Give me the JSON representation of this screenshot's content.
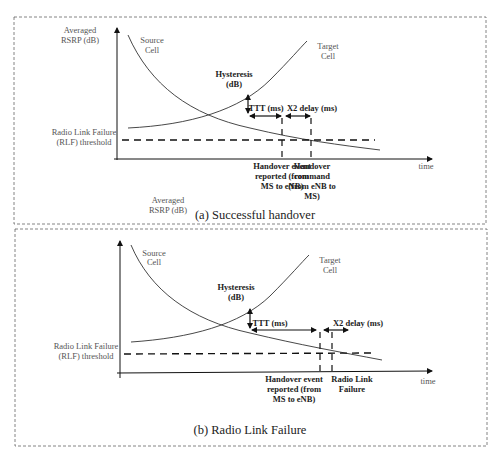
{
  "panels": [
    {
      "caption": "(a) Successful handover",
      "y_axis_label_1": "Averaged",
      "y_axis_label_2": "RSRP (dB)",
      "source_cell_1": "Source",
      "source_cell_2": "Cell",
      "target_cell_1": "Target",
      "target_cell_2": "Cell",
      "hysteresis_1": "Hysteresis",
      "hysteresis_2": "(dB)",
      "ttt": "TTT (ms)",
      "x2_delay": "X2 delay (ms)",
      "rlf_1": "Radio Link Failure",
      "rlf_2": "(RLF) threshold",
      "time": "time",
      "event1_1": "Handover event",
      "event1_2": "reported (from",
      "event1_3": "MS to eNB)",
      "event2_1": "Handover",
      "event2_2": "command",
      "event2_3": "(from eNB to",
      "event2_4": "MS)",
      "extra_label_1": "Averaged",
      "extra_label_2": "RSRP (dB)"
    },
    {
      "caption": "(b) Radio Link Failure",
      "source_cell_1": "Source",
      "source_cell_2": "Cell",
      "target_cell_1": "Target",
      "target_cell_2": "Cell",
      "hysteresis_1": "Hysteresis",
      "hysteresis_2": "(dB)",
      "ttt": "TTT (ms)",
      "x2_delay": "X2 delay (ms)",
      "rlf_1": "Radio Link Failure",
      "rlf_2": "(RLF) threshold",
      "time": "time",
      "event1_1": "Handover event",
      "event1_2": "reported (from",
      "event1_3": "MS to eNB)",
      "event2_1": "Radio Link",
      "event2_2": "Failure"
    }
  ]
}
